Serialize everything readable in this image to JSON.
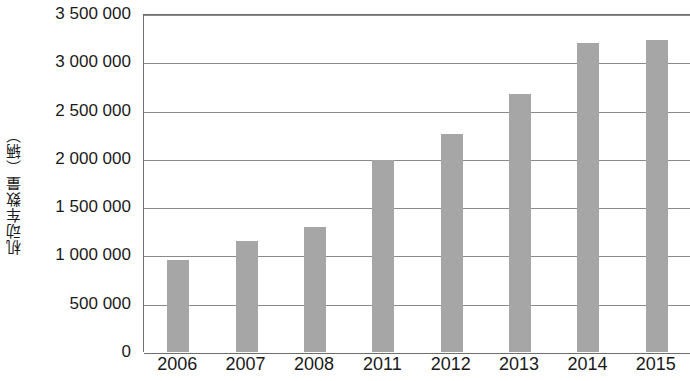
{
  "chart_data": {
    "type": "bar",
    "title": "",
    "subtitle": "",
    "xlabel": "",
    "ylabel": "机动车数量（辆）",
    "categories": [
      "2006",
      "2007",
      "2008",
      "2011",
      "2012",
      "2013",
      "2014",
      "2015"
    ],
    "values": [
      950000,
      1150000,
      1290000,
      1990000,
      2260000,
      2670000,
      3200000,
      3230000
    ],
    "series": [
      {
        "name": "机动车数量",
        "values": [
          950000,
          1150000,
          1290000,
          1990000,
          2260000,
          2670000,
          3200000,
          3230000
        ]
      }
    ],
    "ylim": [
      0,
      3500000
    ],
    "y_tick_values": [
      0,
      500000,
      1000000,
      1500000,
      2000000,
      2500000,
      3000000,
      3500000
    ],
    "y_tick_labels": [
      "0",
      "500 000",
      "1 000 000",
      "1 500 000",
      "2 000 000",
      "2 500 000",
      "3 000 000",
      "3 500 000"
    ],
    "grid": true,
    "grid_axis": "y",
    "legend": false,
    "legend_position": "none",
    "bar_color": "#a6a6a6",
    "grid_color": "#8a8a8a",
    "axis_color": "#6e6e6e",
    "text_color": "#1a1a1a",
    "background_color": "#ffffff",
    "annotations": []
  }
}
